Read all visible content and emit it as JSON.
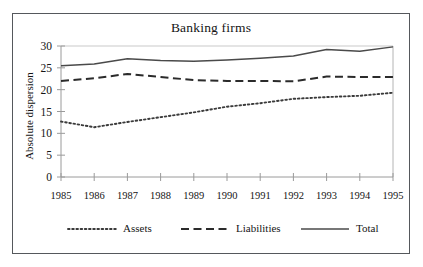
{
  "figure": {
    "title": "Banking firms",
    "border_color": "#55585c",
    "background": "#ffffff"
  },
  "chart_data": {
    "type": "line",
    "title": "Banking firms",
    "xlabel": "",
    "ylabel": "Absolute dispersion",
    "categories": [
      "1985",
      "1986",
      "1987",
      "1988",
      "1989",
      "1990",
      "1991",
      "1992",
      "1993",
      "1994",
      "1995"
    ],
    "x": [
      1985,
      1986,
      1987,
      1988,
      1989,
      1990,
      1991,
      1992,
      1993,
      1994,
      1995
    ],
    "xlim": [
      1985,
      1995
    ],
    "ylim": [
      0,
      30
    ],
    "y_ticks": [
      0,
      5,
      10,
      15,
      20,
      25,
      30
    ],
    "x_ticks": [
      "1985",
      "1986",
      "1987",
      "1988",
      "1989",
      "1990",
      "1991",
      "1992",
      "1993",
      "1994",
      "1995"
    ],
    "grid": false,
    "legend_position": "bottom",
    "series": [
      {
        "name": "Assets",
        "style": "dotted",
        "color": "#3b3b3b",
        "values": [
          12.7,
          11.4,
          12.6,
          13.7,
          14.8,
          16.1,
          16.9,
          17.9,
          18.3,
          18.6,
          19.3
        ]
      },
      {
        "name": "Liabilities",
        "style": "dashed",
        "color": "#2b2b2b",
        "values": [
          22.0,
          22.6,
          23.6,
          22.9,
          22.2,
          22.0,
          22.0,
          21.9,
          23.0,
          22.9,
          22.9
        ]
      },
      {
        "name": "Total",
        "style": "solid",
        "color": "#4a4a4a",
        "values": [
          25.5,
          25.9,
          27.1,
          26.7,
          26.5,
          26.8,
          27.2,
          27.7,
          29.2,
          28.8,
          29.8
        ]
      }
    ]
  },
  "legend": {
    "items": [
      {
        "label": "Assets",
        "style": "dotted"
      },
      {
        "label": "Liabilities",
        "style": "dashed"
      },
      {
        "label": "Total",
        "style": "solid"
      }
    ]
  }
}
